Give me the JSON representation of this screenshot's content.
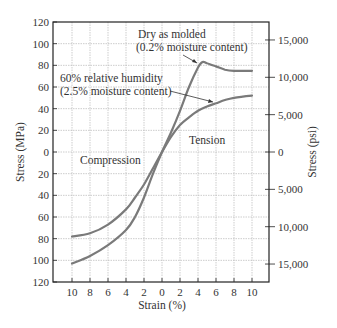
{
  "chart_data": {
    "type": "line",
    "title": "",
    "xlabel": "Strain (%)",
    "ylabel_left": "Stress (MPa)",
    "ylabel_right": "Stress (psi)",
    "x_tick_labels": [
      "10",
      "8",
      "6",
      "4",
      "2",
      "0",
      "2",
      "4",
      "6",
      "8",
      "10"
    ],
    "y_left_tick_labels": [
      "120",
      "100",
      "80",
      "60",
      "40",
      "20",
      "0",
      "20",
      "40",
      "60",
      "80",
      "100",
      "120"
    ],
    "y_right_tick_labels": [
      "15,000",
      "10,000",
      "5,000",
      "0",
      "5,000",
      "10,000",
      "15,000"
    ],
    "xlim": [
      -12,
      12
    ],
    "ylim": [
      -120,
      120
    ],
    "grid": true,
    "region_labels": {
      "compression": "Compression",
      "tension": "Tension"
    },
    "annotations": {
      "dry_line1": "Dry as molded",
      "dry_line2": "(0.2% moisture content)",
      "wet_line1": "60% relative humidity",
      "wet_line2": "(2.5% moisture content)"
    },
    "series": [
      {
        "name": "Dry as molded (0.2% moisture content)",
        "x": [
          -10,
          -8,
          -6,
          -4,
          -3,
          -2,
          -1,
          0,
          1,
          2,
          3,
          4,
          4.5,
          5,
          6,
          7,
          8,
          10
        ],
        "y": [
          -103,
          -96,
          -86,
          -72,
          -60,
          -42,
          -20,
          0,
          18,
          38,
          60,
          78,
          83,
          82,
          79,
          76,
          75,
          75
        ]
      },
      {
        "name": "60% relative humidity (2.5% moisture content)",
        "x": [
          -10,
          -8,
          -6,
          -4,
          -3,
          -2,
          -1,
          0,
          1,
          2,
          3,
          4,
          5,
          6,
          7,
          8,
          10
        ],
        "y": [
          -78,
          -75,
          -67,
          -53,
          -42,
          -30,
          -15,
          0,
          14,
          25,
          32,
          38,
          42,
          45,
          48,
          50,
          52
        ]
      }
    ]
  }
}
